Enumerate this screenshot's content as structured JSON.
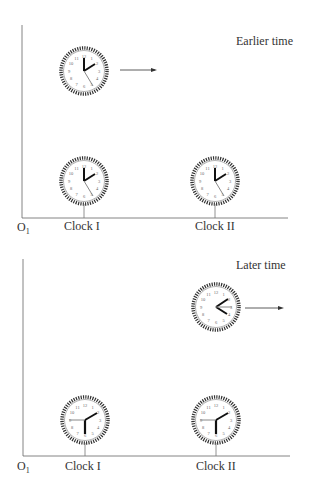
{
  "panels": [
    {
      "title": "Earlier time",
      "origin_label": "O",
      "origin_subscript": "1",
      "clock_labels": [
        "Clock I",
        "Clock II"
      ]
    },
    {
      "title": "Later time",
      "origin_label": "O",
      "origin_subscript": "1",
      "clock_labels": [
        "Clock I",
        "Clock II"
      ]
    }
  ],
  "clock_numerals": [
    "12",
    "1",
    "2",
    "3",
    "4",
    "5",
    "6",
    "7",
    "8",
    "9",
    "10",
    "11"
  ],
  "colors": {
    "line": "#555555",
    "text": "#333333",
    "hand": "#111111"
  }
}
